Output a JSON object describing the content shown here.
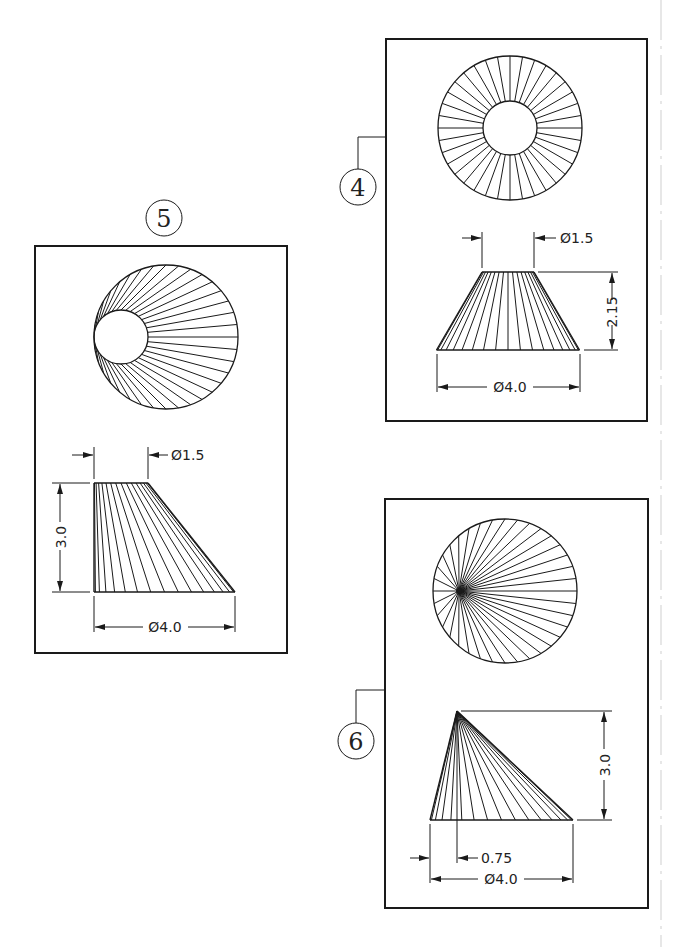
{
  "sheet": {
    "background": "#ffffff",
    "line_color": "#1a1a1a",
    "right_edge_dashed_line": true
  },
  "views": [
    {
      "id": "view-4",
      "label": "4",
      "description": "Truncated right cone (frustum), centered top",
      "top_view": {
        "type": "annulus",
        "radial_lines": 36
      },
      "front_view": {
        "type": "symmetric-frustum",
        "element_lines": 18
      },
      "dimensions": {
        "top_diameter": "Ø1.5",
        "bottom_diameter": "Ø4.0",
        "height": "2.15"
      }
    },
    {
      "id": "view-5",
      "label": "5",
      "description": "Oblique frustum, top tangent to left side",
      "top_view": {
        "type": "eccentric-annulus",
        "radial_lines": 36
      },
      "front_view": {
        "type": "oblique-frustum",
        "element_lines": 16
      },
      "dimensions": {
        "top_diameter": "Ø1.5",
        "bottom_diameter": "Ø4.0",
        "height": "3.0"
      }
    },
    {
      "id": "view-6",
      "label": "6",
      "description": "Oblique cone, apex offset",
      "top_view": {
        "type": "circle-with-offset-apex",
        "radial_lines": 36
      },
      "front_view": {
        "type": "oblique-cone",
        "element_lines": 16
      },
      "dimensions": {
        "apex_offset": "0.75",
        "bottom_diameter": "Ø4.0",
        "height": "3.0"
      }
    }
  ]
}
